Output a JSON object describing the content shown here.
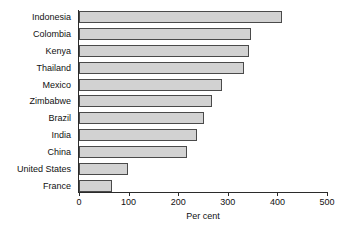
{
  "chart_data": {
    "type": "bar",
    "orientation": "horizontal",
    "title": "",
    "subtitle": "",
    "xlabel": "Per cent",
    "ylabel": "",
    "xlim": [
      0,
      500
    ],
    "xticks": [
      0,
      100,
      200,
      300,
      400,
      500
    ],
    "xtick_labels": [
      "0",
      "100",
      "200",
      "300",
      "400",
      "500"
    ],
    "grid": false,
    "legend": null,
    "categories": [
      "Indonesia",
      "Colombia",
      "Kenya",
      "Thailand",
      "Mexico",
      "Zimbabwe",
      "Brazil",
      "India",
      "China",
      "United States",
      "France"
    ],
    "values": [
      410,
      347,
      343,
      333,
      288,
      268,
      252,
      238,
      218,
      99,
      66
    ],
    "series": [
      {
        "name": "Per cent",
        "values": [
          410,
          347,
          343,
          333,
          288,
          268,
          252,
          238,
          218,
          99,
          66
        ]
      }
    ],
    "bar_fill_color": "#d2d2d2",
    "bar_border_color": "#4a4a4a",
    "axis_color": "#2b2b2b"
  }
}
